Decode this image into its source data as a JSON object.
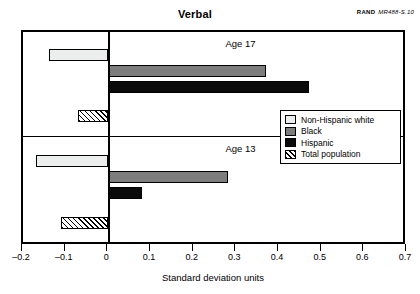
{
  "header": {
    "title": "Verbal",
    "source_org": "RAND",
    "source_id": "MR488-S.10"
  },
  "chart_data": {
    "type": "bar",
    "orientation": "horizontal",
    "title": "Verbal",
    "xlabel": "Standard deviation units",
    "ylabel": "",
    "xlim": [
      -0.2,
      0.7
    ],
    "xticks": [
      -0.2,
      -0.1,
      0,
      0.1,
      0.2,
      0.3,
      0.4,
      0.5,
      0.6,
      0.7
    ],
    "xticklabels": [
      "–0.2",
      "–0.1",
      "0",
      "0.1",
      "0.2",
      "0.3",
      "0.4",
      "0.5",
      "0.6",
      "0.7"
    ],
    "grid": false,
    "legend_position": "center-right",
    "panels": [
      {
        "label": "Age 17",
        "bars": [
          {
            "series": "Non-Hispanic white",
            "value": -0.14,
            "style": "white"
          },
          {
            "series": "Black",
            "value": 0.37,
            "style": "gray"
          },
          {
            "series": "Hispanic",
            "value": 0.47,
            "style": "black"
          },
          {
            "series": "Total population",
            "value": -0.07,
            "style": "hatched"
          }
        ]
      },
      {
        "label": "Age 13",
        "bars": [
          {
            "series": "Non-Hispanic white",
            "value": -0.17,
            "style": "white"
          },
          {
            "series": "Black",
            "value": 0.28,
            "style": "gray"
          },
          {
            "series": "Hispanic",
            "value": 0.08,
            "style": "black"
          },
          {
            "series": "Total population",
            "value": -0.11,
            "style": "hatched"
          }
        ]
      }
    ],
    "series": [
      {
        "name": "Non-Hispanic white",
        "style": "white",
        "color": "#eceded",
        "values": [
          -0.14,
          -0.17
        ]
      },
      {
        "name": "Black",
        "style": "gray",
        "color": "#7d7d7d",
        "values": [
          0.37,
          0.28
        ]
      },
      {
        "name": "Hispanic",
        "style": "black",
        "color": "#0a0a0a",
        "values": [
          0.47,
          0.08
        ]
      },
      {
        "name": "Total population",
        "style": "hatched",
        "color": "#ffffff",
        "values": [
          -0.07,
          -0.11
        ]
      }
    ],
    "categories": [
      "Age 17",
      "Age 13"
    ]
  },
  "legend": {
    "items": [
      {
        "label": "Non-Hispanic white",
        "style": "white"
      },
      {
        "label": "Black",
        "style": "gray"
      },
      {
        "label": "Hispanic",
        "style": "black"
      },
      {
        "label": "Total population",
        "style": "hatched"
      }
    ]
  },
  "axis": {
    "x_title": "Standard deviation units"
  }
}
